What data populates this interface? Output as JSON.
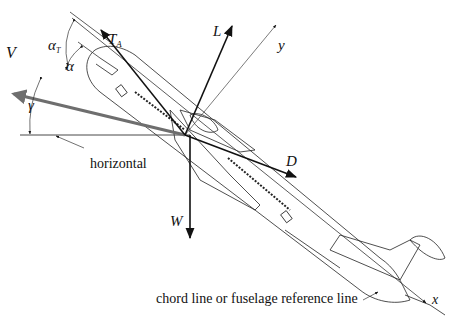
{
  "diagram": {
    "vectors": {
      "velocity": "V",
      "thrust": "T",
      "thrust_sub": "A",
      "lift": "L",
      "drag": "D",
      "weight": "W"
    },
    "axes": {
      "x": "x",
      "y": "y"
    },
    "angles": {
      "alpha_T": "α",
      "alpha_T_sub": "T",
      "alpha": "α",
      "gamma": "γ"
    },
    "annotations": {
      "horizontal": "horizontal",
      "chord_line": "chord line or fuselage reference line"
    },
    "colors": {
      "line": "#111111",
      "velocity_arrow": "#6e6e6e",
      "thin": "#555555"
    }
  }
}
